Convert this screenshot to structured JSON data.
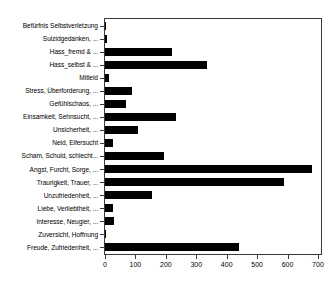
{
  "chart_data": {
    "type": "bar",
    "orientation": "horizontal",
    "title": "",
    "xlabel": "",
    "ylabel": "",
    "xlim": [
      0,
      710
    ],
    "ylim": [
      0,
      18
    ],
    "grid": false,
    "legend": null,
    "bar_color": "#000000",
    "xticks": [
      0,
      100,
      200,
      300,
      400,
      500,
      600,
      700
    ],
    "xtick_labels": [
      "0",
      "100",
      "200",
      "300",
      "400",
      "500",
      "600",
      "700"
    ],
    "categories": [
      "Befürfnis Selbstverletzung",
      "Suizidgedanken, ...",
      "Hass_fremd & ...",
      "Hass_selbst & ...",
      "Mitleid",
      "Stress, Überforderung, ...",
      "Gefühlschaos, ...",
      "Einsamkeit, Sehnsucht, ...",
      "Unsicherheit, ...",
      "Neid, Eifersucht",
      "Scham, Schuld, schlecht...",
      "Angst, Furcht, Sorge, ...",
      "Traurigkeit, Trauer, ...",
      "Unzufriedenheit, ...",
      "Liebe, Verliebtheit, ...",
      "Interesse, Neugier, ...",
      "Zuversicht, Hoffnung",
      "Freude, Zufriedenheit, ..."
    ],
    "values": [
      2,
      5,
      220,
      335,
      13,
      90,
      70,
      235,
      110,
      25,
      195,
      680,
      590,
      155,
      25,
      30,
      2,
      440
    ]
  }
}
